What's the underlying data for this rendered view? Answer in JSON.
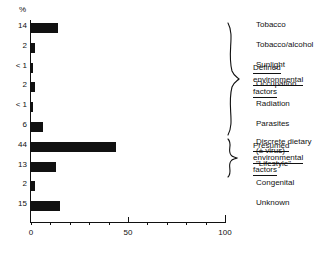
{
  "chart_data": {
    "type": "bar",
    "orientation": "horizontal",
    "title": "",
    "xlabel": "",
    "ylabel": "%",
    "unit_label": "%",
    "xlim": [
      0,
      100
    ],
    "xticks": [
      0,
      10,
      20,
      30,
      40,
      50,
      60,
      70,
      80,
      90,
      100
    ],
    "xtick_labels": [
      "0",
      "50",
      "100"
    ],
    "xtick_label_values": [
      0,
      50,
      100
    ],
    "grid": false,
    "legend": false,
    "categories": [
      "Tobacco",
      "Tobacco/alcohol",
      "Sunlight",
      "Occupation",
      "Radiation",
      "Parasites",
      "Discrete dietary",
      "\"Lifestyle\"",
      "Congenital",
      "Unknown"
    ],
    "category_sublabels": [
      "",
      "",
      "",
      "",
      "",
      "",
      "(± virus)",
      "",
      "",
      ""
    ],
    "value_labels": [
      "14",
      "2",
      "< 1",
      "2",
      "< 1",
      "6",
      "44",
      "13",
      "2",
      "15"
    ],
    "values": [
      14,
      2,
      0.5,
      2,
      0.5,
      6,
      44,
      13,
      2,
      15
    ],
    "bar_color": "#111111"
  },
  "annotations": [
    {
      "name": "defined-environmental-factors",
      "lines": [
        "Defined",
        "environmental",
        "factors"
      ],
      "covers_categories": [
        "Tobacco",
        "Tobacco/alcohol",
        "Sunlight",
        "Occupation",
        "Radiation",
        "Parasites"
      ]
    },
    {
      "name": "presumed-environmental-factors",
      "lines": [
        "Presumed",
        "environmental",
        "factors"
      ],
      "covers_categories": [
        "Discrete dietary",
        "\"Lifestyle\""
      ]
    }
  ]
}
